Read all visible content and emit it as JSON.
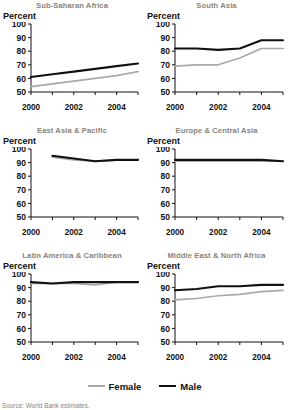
{
  "legend": {
    "female_label": "Female",
    "male_label": "Male"
  },
  "source": {
    "text": "Source: World Bank estimates."
  },
  "colors": {
    "male": "#111111",
    "female": "#a9a9a9",
    "title": "#8a8578",
    "axis": "#111111"
  },
  "axis": {
    "ylabel": "Percent",
    "yticks": [
      "100",
      "90",
      "80",
      "70",
      "60",
      "50"
    ],
    "ymin": 50,
    "ymax": 100,
    "xmin": 2000,
    "xmax": 2005,
    "xticks": [
      2000,
      2001,
      2002,
      2003,
      2004,
      2005
    ],
    "xticklabels": [
      "2000",
      "",
      "2002",
      "",
      "2004",
      ""
    ]
  },
  "chart_data": [
    {
      "type": "line",
      "title": "Sub-Saharan Africa",
      "xlabel": "",
      "ylabel": "Percent",
      "ylim": [
        50,
        100
      ],
      "xlim": [
        2000,
        2005
      ],
      "x": [
        2000,
        2001,
        2002,
        2003,
        2004,
        2005
      ],
      "series": [
        {
          "name": "Male",
          "values": [
            61,
            63,
            65,
            67,
            69,
            71
          ]
        },
        {
          "name": "Female",
          "values": [
            54,
            56,
            58,
            60,
            62,
            65
          ]
        }
      ]
    },
    {
      "type": "line",
      "title": "South Asia",
      "xlabel": "",
      "ylabel": "Percent",
      "ylim": [
        50,
        100
      ],
      "xlim": [
        2000,
        2005
      ],
      "x": [
        2000,
        2001,
        2002,
        2003,
        2004,
        2005
      ],
      "series": [
        {
          "name": "Male",
          "values": [
            82,
            82,
            81,
            82,
            88,
            88
          ]
        },
        {
          "name": "Female",
          "values": [
            69,
            70,
            70,
            75,
            82,
            82
          ]
        }
      ]
    },
    {
      "type": "line",
      "title": "East Asia & Pacific",
      "xlabel": "",
      "ylabel": "Percent",
      "ylim": [
        50,
        100
      ],
      "xlim": [
        2000,
        2005
      ],
      "x": [
        2001,
        2002,
        2003,
        2004,
        2005
      ],
      "series": [
        {
          "name": "Male",
          "values": [
            95,
            93,
            91,
            92,
            92
          ]
        },
        {
          "name": "Female",
          "values": [
            94,
            92,
            91,
            92,
            92
          ]
        }
      ]
    },
    {
      "type": "line",
      "title": "Europe & Central Asia",
      "xlabel": "",
      "ylabel": "Percent",
      "ylim": [
        50,
        100
      ],
      "xlim": [
        2000,
        2005
      ],
      "x": [
        2000,
        2001,
        2002,
        2003,
        2004,
        2005
      ],
      "series": [
        {
          "name": "Male",
          "values": [
            92,
            92,
            92,
            92,
            92,
            91
          ]
        },
        {
          "name": "Female",
          "values": [
            91,
            91,
            91,
            91,
            91,
            91
          ]
        }
      ]
    },
    {
      "type": "line",
      "title": "Latin America & Caribbean",
      "xlabel": "",
      "ylabel": "Percent",
      "ylim": [
        50,
        100
      ],
      "xlim": [
        2000,
        2005
      ],
      "x": [
        2000,
        2001,
        2002,
        2003,
        2004,
        2005
      ],
      "series": [
        {
          "name": "Male",
          "values": [
            94,
            93,
            94,
            94,
            94,
            94
          ]
        },
        {
          "name": "Female",
          "values": [
            93,
            93,
            93,
            92,
            94,
            94
          ]
        }
      ]
    },
    {
      "type": "line",
      "title": "Middle East & North Africa",
      "xlabel": "",
      "ylabel": "Percent",
      "ylim": [
        50,
        100
      ],
      "xlim": [
        2000,
        2005
      ],
      "x": [
        2000,
        2001,
        2002,
        2003,
        2004,
        2005
      ],
      "series": [
        {
          "name": "Male",
          "values": [
            88,
            89,
            91,
            91,
            92,
            92
          ]
        },
        {
          "name": "Female",
          "values": [
            81,
            82,
            84,
            85,
            87,
            88
          ]
        }
      ]
    }
  ]
}
